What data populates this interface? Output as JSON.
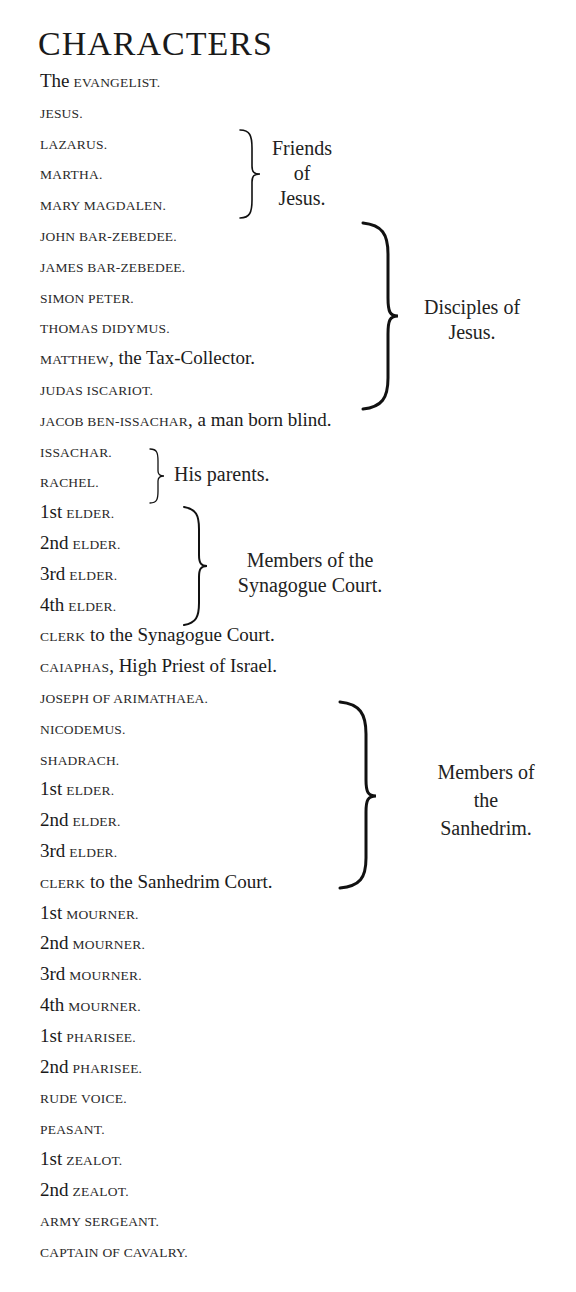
{
  "title": "CHARACTERS",
  "characters": [
    {
      "prefix": "The",
      "name": "EVANGELIST.",
      "suffix": ""
    },
    {
      "prefix": "",
      "name": "JESUS.",
      "suffix": ""
    },
    {
      "prefix": "",
      "name": "LAZARUS.",
      "suffix": ""
    },
    {
      "prefix": "",
      "name": "MARTHA.",
      "suffix": ""
    },
    {
      "prefix": "",
      "name": "MARY MAGDALEN.",
      "suffix": ""
    },
    {
      "prefix": "",
      "name": "JOHN BAR-ZEBEDEE.",
      "suffix": ""
    },
    {
      "prefix": "",
      "name": "JAMES BAR-ZEBEDEE.",
      "suffix": ""
    },
    {
      "prefix": "",
      "name": "SIMON PETER.",
      "suffix": ""
    },
    {
      "prefix": "",
      "name": "THOMAS DIDYMUS.",
      "suffix": ""
    },
    {
      "prefix": "",
      "name": "MATTHEW",
      "suffix": ", the Tax-Collector."
    },
    {
      "prefix": "",
      "name": "JUDAS ISCARIOT.",
      "suffix": ""
    },
    {
      "prefix": "",
      "name": "JACOB BEN-ISSACHAR",
      "suffix": ", a man born blind."
    },
    {
      "prefix": "",
      "name": "ISSACHAR.",
      "suffix": ""
    },
    {
      "prefix": "",
      "name": "RACHEL.",
      "suffix": ""
    },
    {
      "prefix": "1st",
      "name": "ELDER.",
      "suffix": ""
    },
    {
      "prefix": "2nd",
      "name": "ELDER.",
      "suffix": ""
    },
    {
      "prefix": "3rd",
      "name": "ELDER.",
      "suffix": ""
    },
    {
      "prefix": "4th",
      "name": "ELDER.",
      "suffix": ""
    },
    {
      "prefix": "",
      "name": "CLERK",
      "suffix": " to the Synagogue Court."
    },
    {
      "prefix": "",
      "name": "CAIAPHAS",
      "suffix": ", High Priest of Israel."
    },
    {
      "prefix": "",
      "name": "JOSEPH OF ARIMATHAEA.",
      "suffix": ""
    },
    {
      "prefix": "",
      "name": "NICODEMUS.",
      "suffix": ""
    },
    {
      "prefix": "",
      "name": "SHADRACH.",
      "suffix": ""
    },
    {
      "prefix": "1st",
      "name": "ELDER.",
      "suffix": ""
    },
    {
      "prefix": "2nd",
      "name": "ELDER.",
      "suffix": ""
    },
    {
      "prefix": "3rd",
      "name": "ELDER.",
      "suffix": ""
    },
    {
      "prefix": "",
      "name": "CLERK",
      "suffix": " to the Sanhedrim Court."
    },
    {
      "prefix": "1st",
      "name": "MOURNER.",
      "suffix": ""
    },
    {
      "prefix": "2nd",
      "name": "MOURNER.",
      "suffix": ""
    },
    {
      "prefix": "3rd",
      "name": "MOURNER.",
      "suffix": ""
    },
    {
      "prefix": "4th",
      "name": "MOURNER.",
      "suffix": ""
    },
    {
      "prefix": "1st",
      "name": "PHARISEE.",
      "suffix": ""
    },
    {
      "prefix": "2nd",
      "name": "PHARISEE.",
      "suffix": ""
    },
    {
      "prefix": "",
      "name": "RUDE VOICE.",
      "suffix": ""
    },
    {
      "prefix": "",
      "name": "PEASANT.",
      "suffix": ""
    },
    {
      "prefix": "1st",
      "name": "ZEALOT.",
      "suffix": ""
    },
    {
      "prefix": "2nd",
      "name": "ZEALOT.",
      "suffix": ""
    },
    {
      "prefix": "",
      "name": "ARMY SERGEANT.",
      "suffix": ""
    },
    {
      "prefix": "",
      "name": "CAPTAIN OF CAVALRY.",
      "suffix": ""
    }
  ],
  "groups": [
    {
      "label_lines": [
        "Friends",
        "of",
        "Jesus."
      ]
    },
    {
      "label_lines": [
        "Disciples of",
        "Jesus."
      ]
    },
    {
      "label_lines": [
        "His parents."
      ]
    },
    {
      "label_lines": [
        "Members of the",
        "Synagogue Court."
      ]
    },
    {
      "label_lines": [
        "Members of",
        "the",
        "Sanhedrim."
      ]
    }
  ]
}
